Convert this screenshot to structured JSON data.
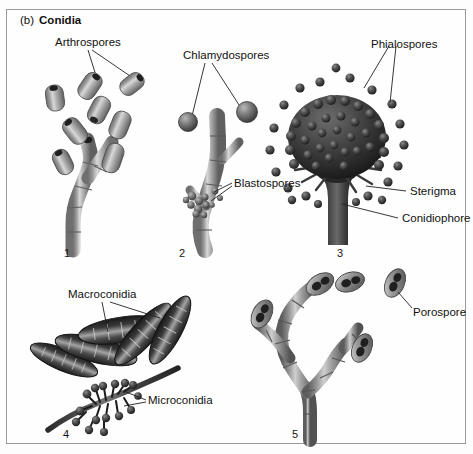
{
  "figure": {
    "panel_letter": "(b)",
    "panel_title": "Conidia",
    "frame_color": "#9a9a9a",
    "background_color": "#fefefe",
    "ink_color": "#111111"
  },
  "labels": {
    "arthrospores": "Arthrospores",
    "chlamydospores": "Chlamydospores",
    "phialospores": "Phialospores",
    "blastospores": "Blastospores",
    "sterigma": "Sterigma",
    "conidiophore": "Conidiophore",
    "macroconidia": "Macroconidia",
    "microconidia": "Microconidia",
    "porospore": "Porospore"
  },
  "panel_numbers": {
    "one": "1",
    "two": "2",
    "three": "3",
    "four": "4",
    "five": "5"
  },
  "panels": [
    {
      "number": "1",
      "label": "Arthrospores",
      "description": "Hypha fragmenting into barrel-shaped arthrospores"
    },
    {
      "number": "2",
      "label": "Chlamydospores",
      "secondary_label": "Blastospores",
      "description": "Thick-walled chlamydospores on a hypha with budding blastospores"
    },
    {
      "number": "3",
      "label": "Phialospores",
      "secondary_label": "Sterigma",
      "tertiary_label": "Conidiophore",
      "description": "Aspergillus-type conidiophore bearing radiating sterigmata and phialospores"
    },
    {
      "number": "4",
      "label": "Macroconidia",
      "secondary_label": "Microconidia",
      "description": "Multicellular macroconidia and small microconidia on a branch"
    },
    {
      "number": "5",
      "label": "Porospore",
      "description": "Branched hypha producing porospores"
    }
  ]
}
